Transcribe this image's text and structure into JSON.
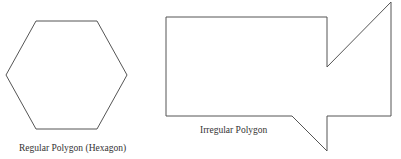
{
  "figures": [
    {
      "id": "hexagon",
      "caption": "Regular Polygon (Hexagon)",
      "points": "36,21 97,21 127,75 97,129 36,129 6,75"
    },
    {
      "id": "irregular",
      "caption": "Irregular Polygon",
      "points": "166,17 327,17 327,67 391,2 391,116 327,116 327,151 292,116 166,116"
    }
  ],
  "colors": {
    "stroke": "#555555",
    "background": "#ffffff",
    "text": "#333333"
  }
}
